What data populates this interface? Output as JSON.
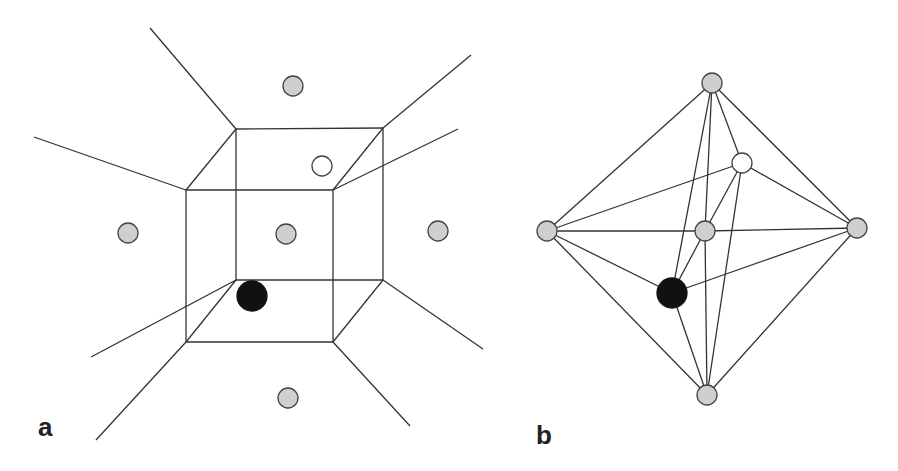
{
  "colors": {
    "line": "#333333",
    "atom_gray_fill": "#cfcfcf",
    "atom_stroke": "#444444",
    "atom_white_fill": "#ffffff",
    "atom_black_fill": "#111111"
  },
  "panels": [
    {
      "label": "a",
      "label_pos": [
        38,
        414
      ],
      "description": "Cube with Voronoi-like extended edges and surrounding atoms",
      "lines": [
        [
          186,
          190,
          333,
          190
        ],
        [
          333,
          190,
          333,
          342
        ],
        [
          333,
          342,
          186,
          342
        ],
        [
          186,
          342,
          186,
          190
        ],
        [
          236,
          129,
          383,
          128
        ],
        [
          383,
          128,
          383,
          280
        ],
        [
          383,
          280,
          236,
          280
        ],
        [
          236,
          280,
          236,
          129
        ],
        [
          186,
          190,
          236,
          129
        ],
        [
          333,
          190,
          383,
          128
        ],
        [
          333,
          342,
          383,
          280
        ],
        [
          186,
          342,
          236,
          280
        ],
        [
          236,
          129,
          150,
          28
        ],
        [
          383,
          128,
          471,
          55
        ],
        [
          186,
          190,
          34,
          137
        ],
        [
          333,
          190,
          458,
          129
        ],
        [
          236,
          280,
          91,
          357
        ],
        [
          186,
          342,
          96,
          440
        ],
        [
          383,
          280,
          483,
          349
        ],
        [
          333,
          342,
          410,
          426
        ]
      ],
      "atoms": [
        {
          "x": 293,
          "y": 86,
          "type": "gray"
        },
        {
          "x": 128,
          "y": 233,
          "type": "gray"
        },
        {
          "x": 286,
          "y": 234,
          "type": "gray"
        },
        {
          "x": 438,
          "y": 231,
          "type": "gray"
        },
        {
          "x": 288,
          "y": 398,
          "type": "gray"
        },
        {
          "x": 322,
          "y": 166,
          "type": "white"
        },
        {
          "x": 252,
          "y": 296,
          "type": "black",
          "r": 15
        }
      ]
    },
    {
      "label": "b",
      "label_pos": [
        536,
        422
      ],
      "description": "Octahedral connectivity graph",
      "nodes": {
        "top": [
          712,
          83
        ],
        "white": [
          742,
          163
        ],
        "left": [
          547,
          231
        ],
        "center": [
          705,
          231
        ],
        "right": [
          857,
          228
        ],
        "black": [
          672,
          293
        ],
        "bottom": [
          707,
          395
        ]
      },
      "edges": [
        [
          "top",
          "left"
        ],
        [
          "top",
          "right"
        ],
        [
          "top",
          "black"
        ],
        [
          "top",
          "center"
        ],
        [
          "top",
          "white"
        ],
        [
          "left",
          "white"
        ],
        [
          "left",
          "center"
        ],
        [
          "left",
          "black"
        ],
        [
          "left",
          "bottom"
        ],
        [
          "right",
          "white"
        ],
        [
          "right",
          "center"
        ],
        [
          "right",
          "black"
        ],
        [
          "right",
          "bottom"
        ],
        [
          "bottom",
          "black"
        ],
        [
          "bottom",
          "center"
        ],
        [
          "bottom",
          "white"
        ],
        [
          "white",
          "center"
        ],
        [
          "center",
          "black"
        ]
      ],
      "atoms": [
        {
          "node": "top",
          "type": "gray"
        },
        {
          "node": "left",
          "type": "gray"
        },
        {
          "node": "center",
          "type": "gray"
        },
        {
          "node": "right",
          "type": "gray"
        },
        {
          "node": "bottom",
          "type": "gray"
        },
        {
          "node": "white",
          "type": "white"
        },
        {
          "node": "black",
          "type": "black",
          "r": 15
        }
      ]
    }
  ]
}
